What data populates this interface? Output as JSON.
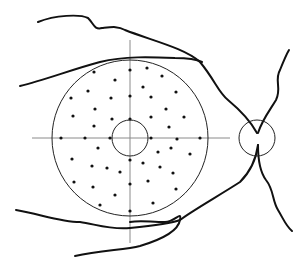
{
  "diagram": {
    "type": "retinal-fundus-test-grid",
    "colors": {
      "background": "#ffffff",
      "vessel": "#111111",
      "outline": "#222222",
      "axis": "#8a8a8a",
      "point": "#111111"
    },
    "field_circle": {
      "cx": 130,
      "cy": 138,
      "r": 78
    },
    "fovea_circle": {
      "cx": 130,
      "cy": 138,
      "r": 18
    },
    "optic_disc": {
      "cx": 257,
      "cy": 138,
      "r": 18
    },
    "crosshair": {
      "horizontal": {
        "x1": 32,
        "x2": 230,
        "y": 138
      },
      "vertical": {
        "x": 130,
        "y1": 40,
        "y2": 243
      }
    },
    "test_points": [
      [
        94,
        72
      ],
      [
        130,
        70
      ],
      [
        147,
        68
      ],
      [
        162,
        76
      ],
      [
        115,
        80
      ],
      [
        143,
        87
      ],
      [
        88,
        91
      ],
      [
        176,
        92
      ],
      [
        71,
        98
      ],
      [
        111,
        98
      ],
      [
        130,
        96
      ],
      [
        151,
        97
      ],
      [
        95,
        109
      ],
      [
        166,
        109
      ],
      [
        73,
        116
      ],
      [
        112,
        119
      ],
      [
        130,
        119
      ],
      [
        151,
        117
      ],
      [
        184,
        117
      ],
      [
        94,
        126
      ],
      [
        169,
        127
      ],
      [
        61,
        138
      ],
      [
        85,
        138
      ],
      [
        110,
        138
      ],
      [
        151,
        138
      ],
      [
        177,
        139
      ],
      [
        200,
        138
      ],
      [
        98,
        148
      ],
      [
        171,
        148
      ],
      [
        158,
        152
      ],
      [
        190,
        154
      ],
      [
        72,
        159
      ],
      [
        130,
        160
      ],
      [
        143,
        163
      ],
      [
        92,
        166
      ],
      [
        107,
        168
      ],
      [
        120,
        172
      ],
      [
        160,
        167
      ],
      [
        173,
        173
      ],
      [
        74,
        182
      ],
      [
        148,
        181
      ],
      [
        130,
        184
      ],
      [
        93,
        187
      ],
      [
        176,
        189
      ],
      [
        115,
        195
      ],
      [
        100,
        205
      ],
      [
        153,
        203
      ],
      [
        130,
        211
      ]
    ],
    "vessels": [
      {
        "name": "superior-temporal-arcade-outer",
        "d": "M38,22 C55,15 80,14 88,18 C94,24 94,30 102,28 C112,27 118,26 125,30 C150,40 185,48 200,62 C215,80 218,92 228,100 C240,110 250,120 257,133"
      },
      {
        "name": "superior-temporal-arcade-inner",
        "d": "M20,86 C45,80 70,70 100,62 C125,56 150,57 175,58 C190,58 198,60 202,62"
      },
      {
        "name": "inferior-temporal-arcade-outer",
        "d": "M16,210 C40,214 60,222 80,222 C95,224 110,230 130,228 C150,226 170,224 180,220 C190,212 220,195 240,182 C250,172 256,160 258,145"
      },
      {
        "name": "inferior-temporal-arcade-inner",
        "d": "M75,256 C100,250 125,250 140,246 C160,240 178,232 180,220 C182,210 175,222 165,222 C150,222 140,220 130,222"
      },
      {
        "name": "superior-nasal-vessel",
        "d": "M258,133 C262,120 270,110 276,100 C282,88 274,80 280,70 C284,60 286,55 289,50"
      },
      {
        "name": "inferior-nasal-vessel",
        "d": "M258,145 C258,160 260,172 266,180 C274,190 272,200 278,210 C284,220 286,226 292,231"
      }
    ]
  }
}
